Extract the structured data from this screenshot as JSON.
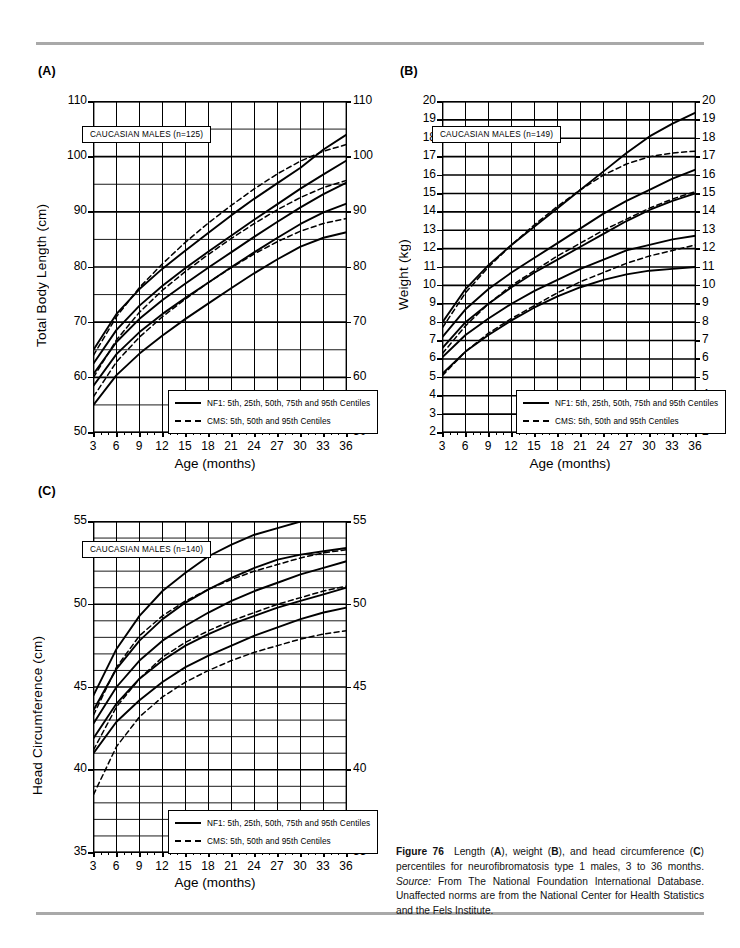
{
  "figure": {
    "number_label": "Figure 76",
    "caption_parts": {
      "lead": "Figure 76",
      "text1": "Length (",
      "a": "A",
      "text2": "), weight (",
      "b": "B",
      "text3": "), and head circumference (",
      "c": "C",
      "text4": ") percentiles for neurofibromatosis type 1 males, 3 to 36 months. ",
      "source_label": "Source:",
      "source_text": " From The National Foundation International Database. Unaffected norms are from the National Center for Health Statistics and the Fels Institute."
    }
  },
  "legend": {
    "nf1": "NF1: 5th, 25th, 50th, 75th and 95th Centiles",
    "cms": "CMS: 5th, 50th and 95th Centiles"
  },
  "panels": {
    "a": {
      "label": "(A)",
      "nbox": "CAUCASIAN MALES (n=125)"
    },
    "b": {
      "label": "(B)",
      "nbox": "CAUCASIAN MALES (n=149)"
    },
    "c": {
      "label": "(C)",
      "nbox": "CAUCASIAN MALES (n=140)"
    }
  },
  "chart_data": [
    {
      "id": "a",
      "type": "line",
      "title": "",
      "panel_label": "(A)",
      "annotation": "CAUCASIAN MALES (n=125)",
      "xlabel": "Age (months)",
      "ylabel": "Total Body Length (cm)",
      "x": [
        3,
        6,
        9,
        12,
        15,
        18,
        21,
        24,
        27,
        30,
        33,
        36
      ],
      "xlim": [
        3,
        36
      ],
      "ylim": [
        50,
        110
      ],
      "xticks": [
        3,
        6,
        9,
        12,
        15,
        18,
        21,
        24,
        27,
        30,
        33,
        36
      ],
      "yticks": [
        50,
        60,
        70,
        80,
        90,
        100,
        110
      ],
      "y_minor_step": 5,
      "grid": true,
      "right_axis_mirrored": true,
      "legend_position": "bottom-right-inside",
      "series": [
        {
          "name": "NF1 95th Centile",
          "style": "solid",
          "values": [
            65.0,
            71.5,
            76.0,
            79.7,
            83.0,
            86.2,
            89.4,
            92.4,
            95.2,
            98.0,
            101.3,
            104.0
          ]
        },
        {
          "name": "NF1 75th Centile",
          "style": "solid",
          "values": [
            62.5,
            68.6,
            73.0,
            76.6,
            79.8,
            82.8,
            85.7,
            88.6,
            91.4,
            94.2,
            96.8,
            99.3
          ]
        },
        {
          "name": "NF1 50th Centile",
          "style": "solid",
          "values": [
            60.6,
            66.4,
            70.6,
            74.0,
            77.0,
            79.9,
            82.7,
            85.5,
            88.2,
            90.8,
            93.2,
            95.3
          ]
        },
        {
          "name": "NF1 25th Centile",
          "style": "solid",
          "values": [
            58.5,
            64.2,
            68.2,
            71.5,
            74.4,
            77.2,
            80.0,
            82.7,
            85.3,
            87.8,
            89.9,
            91.5
          ]
        },
        {
          "name": "NF1 5th Centile",
          "style": "solid",
          "values": [
            55.0,
            60.4,
            64.3,
            67.6,
            70.6,
            73.4,
            76.2,
            78.9,
            81.4,
            83.7,
            85.3,
            86.3
          ]
        },
        {
          "name": "CMS 95th Centile",
          "style": "dashed",
          "values": [
            64.0,
            71.0,
            76.3,
            80.6,
            84.5,
            88.0,
            91.2,
            94.2,
            96.9,
            99.2,
            101.0,
            102.2
          ]
        },
        {
          "name": "CMS 50th Centile",
          "style": "dashed",
          "values": [
            60.0,
            66.8,
            71.8,
            75.8,
            79.2,
            82.3,
            85.2,
            87.9,
            90.4,
            92.6,
            94.4,
            95.7
          ]
        },
        {
          "name": "CMS 5th Centile",
          "style": "dashed",
          "values": [
            56.5,
            62.8,
            67.3,
            71.0,
            74.2,
            77.2,
            79.9,
            82.4,
            84.6,
            86.5,
            87.9,
            88.8
          ]
        }
      ]
    },
    {
      "id": "b",
      "type": "line",
      "title": "",
      "panel_label": "(B)",
      "annotation": "CAUCASIAN MALES (n=149)",
      "xlabel": "Age (months)",
      "ylabel": "Weight (kg)",
      "x": [
        3,
        6,
        9,
        12,
        15,
        18,
        21,
        24,
        27,
        30,
        33,
        36
      ],
      "xlim": [
        3,
        36
      ],
      "ylim": [
        2,
        20
      ],
      "xticks": [
        3,
        6,
        9,
        12,
        15,
        18,
        21,
        24,
        27,
        30,
        33,
        36
      ],
      "yticks": [
        2,
        3,
        4,
        5,
        6,
        7,
        8,
        9,
        10,
        11,
        12,
        13,
        14,
        15,
        16,
        17,
        18,
        19,
        20
      ],
      "y_minor_step": 1,
      "grid": true,
      "right_axis_mirrored": true,
      "legend_position": "bottom-right-inside",
      "series": [
        {
          "name": "NF1 95th Centile",
          "style": "solid",
          "values": [
            8.0,
            9.8,
            11.1,
            12.2,
            13.2,
            14.2,
            15.2,
            16.2,
            17.2,
            18.1,
            18.8,
            19.4
          ]
        },
        {
          "name": "NF1 75th Centile",
          "style": "solid",
          "values": [
            7.2,
            8.7,
            9.8,
            10.7,
            11.5,
            12.3,
            13.1,
            13.9,
            14.6,
            15.2,
            15.8,
            16.3
          ]
        },
        {
          "name": "NF1 50th Centile",
          "style": "solid",
          "values": [
            6.6,
            8.0,
            9.0,
            9.9,
            10.7,
            11.4,
            12.1,
            12.8,
            13.5,
            14.1,
            14.6,
            15.0
          ]
        },
        {
          "name": "NF1 25th Centile",
          "style": "solid",
          "values": [
            6.1,
            7.3,
            8.2,
            9.0,
            9.7,
            10.3,
            10.9,
            11.4,
            11.9,
            12.2,
            12.5,
            12.7
          ]
        },
        {
          "name": "NF1 5th Centile",
          "style": "solid",
          "values": [
            5.2,
            6.4,
            7.3,
            8.1,
            8.8,
            9.4,
            9.9,
            10.3,
            10.6,
            10.8,
            10.9,
            11.0
          ]
        },
        {
          "name": "CMS 95th Centile",
          "style": "dashed",
          "values": [
            7.7,
            9.6,
            11.0,
            12.2,
            13.3,
            14.3,
            15.2,
            16.0,
            16.6,
            17.0,
            17.2,
            17.3
          ]
        },
        {
          "name": "CMS 50th Centile",
          "style": "dashed",
          "values": [
            6.3,
            7.8,
            9.0,
            10.0,
            10.8,
            11.6,
            12.3,
            13.0,
            13.6,
            14.2,
            14.7,
            15.1
          ]
        },
        {
          "name": "CMS 5th Centile",
          "style": "dashed",
          "values": [
            5.1,
            6.4,
            7.4,
            8.2,
            8.9,
            9.6,
            10.2,
            10.7,
            11.2,
            11.6,
            11.9,
            12.2
          ]
        }
      ]
    },
    {
      "id": "c",
      "type": "line",
      "title": "",
      "panel_label": "(C)",
      "annotation": "CAUCASIAN MALES (n=140)",
      "xlabel": "Age (months)",
      "ylabel": "Head Circumference (cm)",
      "x": [
        3,
        6,
        9,
        12,
        15,
        18,
        21,
        24,
        27,
        30,
        33,
        36
      ],
      "xlim": [
        3,
        36
      ],
      "ylim": [
        35,
        55
      ],
      "xticks": [
        3,
        6,
        9,
        12,
        15,
        18,
        21,
        24,
        27,
        30,
        33,
        36
      ],
      "yticks": [
        35,
        40,
        45,
        50,
        55
      ],
      "y_minor_step": 1,
      "grid": true,
      "right_axis_mirrored": true,
      "legend_position": "bottom-right-inside",
      "series": [
        {
          "name": "NF1 95th Centile",
          "style": "solid",
          "values": [
            44.5,
            47.3,
            49.3,
            50.8,
            51.9,
            52.9,
            53.6,
            54.2,
            54.6,
            55.0,
            55.3,
            55.5
          ]
        },
        {
          "name": "NF1 75th Centile",
          "style": "solid",
          "values": [
            43.6,
            46.1,
            47.8,
            49.1,
            50.1,
            50.9,
            51.6,
            52.2,
            52.7,
            53.0,
            53.2,
            53.4
          ]
        },
        {
          "name": "NF1 50th Centile",
          "style": "solid",
          "values": [
            42.8,
            45.0,
            46.6,
            47.8,
            48.7,
            49.5,
            50.2,
            50.8,
            51.3,
            51.8,
            52.2,
            52.6
          ]
        },
        {
          "name": "NF1 25th Centile",
          "style": "solid",
          "values": [
            41.9,
            44.0,
            45.5,
            46.6,
            47.5,
            48.2,
            48.8,
            49.3,
            49.8,
            50.2,
            50.6,
            51.0
          ]
        },
        {
          "name": "NF1 5th Centile",
          "style": "solid",
          "values": [
            41.0,
            42.9,
            44.2,
            45.3,
            46.2,
            46.9,
            47.5,
            48.1,
            48.6,
            49.1,
            49.5,
            49.8
          ]
        },
        {
          "name": "CMS 95th Centile",
          "style": "dashed",
          "values": [
            43.3,
            46.2,
            48.1,
            49.3,
            50.2,
            50.9,
            51.5,
            52.0,
            52.4,
            52.8,
            53.1,
            53.3
          ]
        },
        {
          "name": "CMS 50th Centile",
          "style": "dashed",
          "values": [
            41.2,
            43.8,
            45.5,
            46.8,
            47.7,
            48.4,
            49.0,
            49.5,
            50.0,
            50.4,
            50.8,
            51.1
          ]
        },
        {
          "name": "CMS 5th Centile",
          "style": "dashed",
          "values": [
            38.5,
            41.4,
            43.2,
            44.4,
            45.3,
            46.0,
            46.6,
            47.1,
            47.5,
            47.9,
            48.2,
            48.4
          ]
        }
      ]
    }
  ]
}
